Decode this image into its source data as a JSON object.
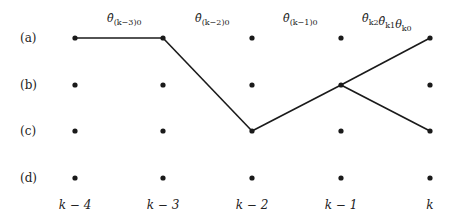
{
  "diagram": {
    "type": "trellis-path",
    "rows": [
      {
        "id": "a",
        "label": "(a)",
        "y": 38
      },
      {
        "id": "b",
        "label": "(b)",
        "y": 85
      },
      {
        "id": "c",
        "label": "(c)",
        "y": 131
      },
      {
        "id": "d",
        "label": "(d)",
        "y": 178
      }
    ],
    "columns": [
      {
        "id": "k-4",
        "label": "k − 4",
        "x": 75
      },
      {
        "id": "k-3",
        "label": "k − 3",
        "x": 163
      },
      {
        "id": "k-2",
        "label": "k − 2",
        "x": 252
      },
      {
        "id": "k-1",
        "label": "k − 1",
        "x": 341
      },
      {
        "id": "k",
        "label": "k",
        "x": 430
      }
    ],
    "edges": [
      {
        "from": [
          "k-4",
          "a"
        ],
        "to": [
          "k-3",
          "a"
        ]
      },
      {
        "from": [
          "k-3",
          "a"
        ],
        "to": [
          "k-2",
          "c"
        ]
      },
      {
        "from": [
          "k-2",
          "c"
        ],
        "to": [
          "k-1",
          "b"
        ]
      },
      {
        "from": [
          "k-1",
          "b"
        ],
        "to": [
          "k",
          "a"
        ]
      },
      {
        "from": [
          "k-1",
          "b"
        ],
        "to": [
          "k",
          "c"
        ]
      }
    ],
    "edge_labels": [
      {
        "base": "θ̂",
        "sub": "(k−3)0",
        "x": 107,
        "y": 22
      },
      {
        "base": "θ̂",
        "sub": "(k−2)0",
        "x": 195,
        "y": 22
      },
      {
        "base": "θ̂",
        "sub": "(k−1)0",
        "x": 283,
        "y": 22
      },
      {
        "base": "θ̂",
        "sub": "k2",
        "base2": "θ̂",
        "sub2": "k1",
        "base3": "θ",
        "sub3": "k0",
        "x": 362,
        "y": 22
      }
    ]
  }
}
